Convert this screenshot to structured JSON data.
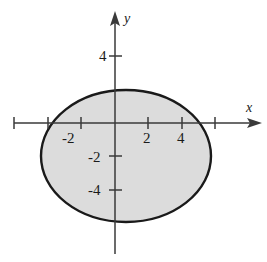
{
  "figure": {
    "kind": "coordinate-plane-with-shaded-ellipse",
    "background_color": "#ffffff",
    "axis_color": "#3a3a3a",
    "curve_color": "#1a1a1a",
    "fill_color": "#dcdcdc"
  },
  "axes": {
    "x_name": "x",
    "y_name": "y",
    "x_tick_labels": [
      "-2",
      "2",
      "4"
    ],
    "y_tick_labels": [
      "4",
      "-2",
      "-4"
    ]
  },
  "chart_data": {
    "type": "area",
    "title": "",
    "xlabel": "x",
    "ylabel": "y",
    "grid": false,
    "legend": null,
    "xlim": [
      -6.0,
      8.8
    ],
    "ylim": [
      -8.3,
      6.6
    ],
    "x_ticks": [
      -6,
      -4,
      -2,
      0,
      2,
      4,
      6
    ],
    "x_tick_labels_shown": {
      "-2": "-2",
      "2": "2",
      "4": "4"
    },
    "y_ticks": [
      4,
      -2,
      -4
    ],
    "y_tick_labels_shown": {
      "4": "4",
      "-2": "-2",
      "-4": "-4"
    },
    "tick_spacing_units": 2,
    "pixels_per_unit": 16.75,
    "origin_px": {
      "x": 115,
      "y": 123
    },
    "series": [
      {
        "name": "shaded-ellipse-region",
        "shape": "ellipse",
        "center": [
          0.67,
          -2.0
        ],
        "semi_axis_x": 5.07,
        "semi_axis_y": 3.94,
        "center_px": [
          126,
          156
        ],
        "semi_axis_px": [
          85,
          66
        ],
        "filled": true,
        "fill_color": "#dcdcdc",
        "edge_color": "#1a1a1a",
        "edge_width_px": 2.4,
        "extent_x": [
          -4.4,
          5.74
        ],
        "extent_y": [
          -5.94,
          1.94
        ]
      }
    ],
    "annotations": []
  }
}
